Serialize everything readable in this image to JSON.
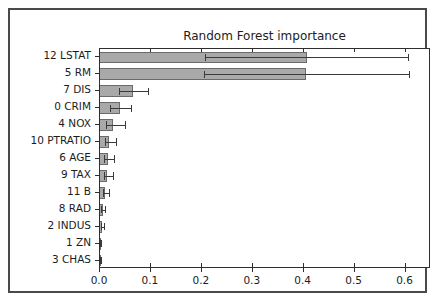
{
  "chart_data": {
    "type": "bar",
    "orientation": "horizontal",
    "title": "Random Forest importance",
    "xlabel": "",
    "ylabel": "",
    "xlim": [
      0.0,
      0.65
    ],
    "xticks": [
      "0.0",
      "0.1",
      "0.2",
      "0.3",
      "0.4",
      "0.5",
      "0.6"
    ],
    "xtick_values": [
      0.0,
      0.1,
      0.2,
      0.3,
      0.4,
      0.5,
      0.6
    ],
    "grid": false,
    "legend": "none",
    "bar_color": "#a9a9a9",
    "bar_edge_color": "#6b6b6b",
    "error_bar_color": "#3a3a3a",
    "categories": [
      "12 LSTAT",
      "5 RM",
      "7 DIS",
      "0 CRIM",
      "4 NOX",
      "10 PTRATIO",
      "6 AGE",
      "9 TAX",
      "11 B",
      "8 RAD",
      "2 INDUS",
      "1 ZN",
      "3 CHAS"
    ],
    "values": [
      0.408,
      0.407,
      0.065,
      0.04,
      0.026,
      0.017,
      0.015,
      0.014,
      0.01,
      0.005,
      0.004,
      0.001,
      0.001
    ],
    "error_low": [
      0.207,
      0.206,
      0.038,
      0.019,
      0.012,
      0.009,
      0.008,
      0.008,
      0.005,
      0.002,
      0.001,
      0.0,
      0.0
    ],
    "error_high": [
      0.609,
      0.61,
      0.095,
      0.062,
      0.05,
      0.032,
      0.028,
      0.026,
      0.018,
      0.01,
      0.008,
      0.002,
      0.002
    ]
  }
}
